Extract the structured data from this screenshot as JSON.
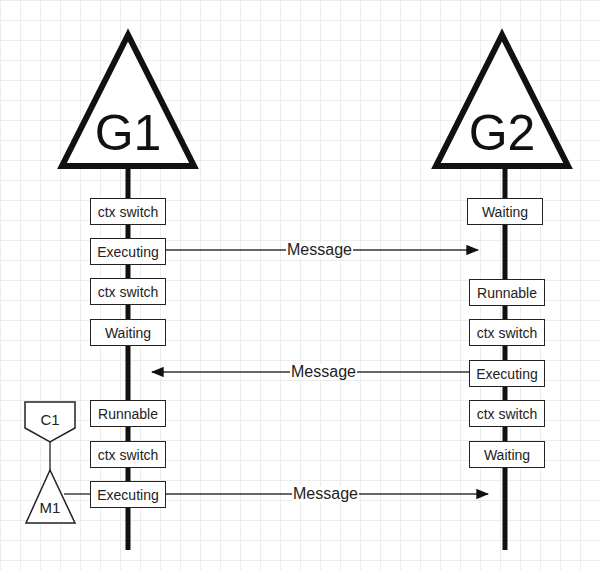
{
  "diagram": {
    "type": "goroutine-scheduling-timeline",
    "goroutines": [
      {
        "id": "g1",
        "label": "G1",
        "states": [
          "ctx switch",
          "Executing",
          "ctx switch",
          "Waiting",
          "Runnable",
          "ctx switch",
          "Executing"
        ]
      },
      {
        "id": "g2",
        "label": "G2",
        "states": [
          "Waiting",
          "Runnable",
          "ctx switch",
          "Executing",
          "ctx switch",
          "Waiting"
        ]
      }
    ],
    "messages": [
      {
        "label": "Message",
        "from": "G1 Executing",
        "to": "G2",
        "direction": "right"
      },
      {
        "label": "Message",
        "from": "G2 Executing",
        "to": "G1",
        "direction": "left"
      },
      {
        "label": "Message",
        "from": "G1 Executing",
        "to": "G2",
        "direction": "right"
      }
    ],
    "core": {
      "label": "C1"
    },
    "machine": {
      "label": "M1"
    },
    "colors": {
      "line": "#111111",
      "box_border": "#222222",
      "grid": "#ececec",
      "background": "#ffffff"
    }
  }
}
